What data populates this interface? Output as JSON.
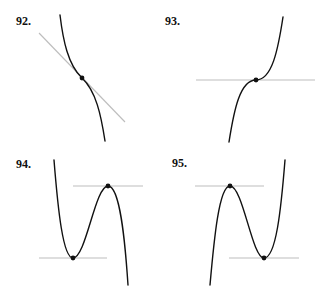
{
  "panels": [
    {
      "label": "92.",
      "description": "Decreasing curve with inflection point and slanted tangent line",
      "points": [
        {
          "type": "inflection",
          "tangent": "slanted"
        }
      ]
    },
    {
      "label": "93.",
      "description": "Increasing cubic with horizontal tangent at inflection point",
      "points": [
        {
          "type": "inflection",
          "tangent": "horizontal"
        }
      ]
    },
    {
      "label": "94.",
      "description": "Curve with local minimum then local maximum, horizontal tangents at each",
      "points": [
        {
          "type": "local-min",
          "tangent": "horizontal"
        },
        {
          "type": "local-max",
          "tangent": "horizontal"
        }
      ]
    },
    {
      "label": "95.",
      "description": "Curve with local maximum then local minimum, horizontal tangents at each",
      "points": [
        {
          "type": "local-max",
          "tangent": "horizontal"
        },
        {
          "type": "local-min",
          "tangent": "horizontal"
        }
      ]
    }
  ],
  "colors": {
    "curve": "#111111",
    "tangent": "#bdbdbd",
    "background": "#ffffff"
  }
}
